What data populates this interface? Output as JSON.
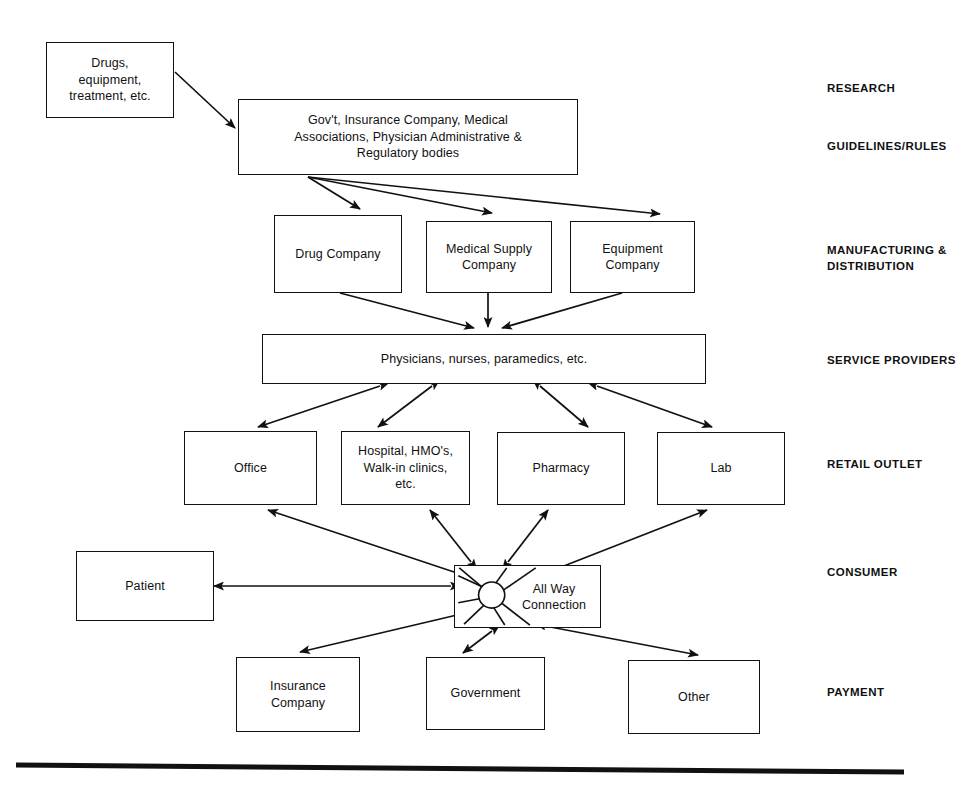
{
  "diagram": {
    "background_color": "#ffffff",
    "line_color": "#111111",
    "nodes": {
      "research": {
        "label": "Drugs,\nequipment,\ntreatment, etc."
      },
      "guidelines": {
        "label": "Gov't, Insurance Company, Medical\nAssociations, Physician Administrative &\nRegulatory bodies"
      },
      "drug_company": {
        "label": "Drug Company"
      },
      "medical_supply": {
        "label": "Medical Supply\nCompany"
      },
      "equipment_company": {
        "label": "Equipment\nCompany"
      },
      "service_providers": {
        "label": "Physicians, nurses, paramedics, etc."
      },
      "office": {
        "label": "Office"
      },
      "hospital": {
        "label": "Hospital, HMO's,\nWalk-in clinics,\netc."
      },
      "pharmacy": {
        "label": "Pharmacy"
      },
      "lab": {
        "label": "Lab"
      },
      "patient": {
        "label": "Patient"
      },
      "all_way_connection": {
        "label": "All Way\nConnection"
      },
      "insurance_company": {
        "label": "Insurance\nCompany"
      },
      "government": {
        "label": "Government"
      },
      "other": {
        "label": "Other"
      }
    },
    "stage_labels": [
      {
        "id": "research",
        "label": "RESEARCH"
      },
      {
        "id": "guidelines",
        "label": "GUIDELINES/RULES"
      },
      {
        "id": "manufacturing",
        "label": "MANUFACTURING &\nDISTRIBUTION"
      },
      {
        "id": "service_providers",
        "label": "SERVICE PROVIDERS"
      },
      {
        "id": "retail_outlet",
        "label": "RETAIL OUTLET"
      },
      {
        "id": "consumer",
        "label": "CONSUMER"
      },
      {
        "id": "payment",
        "label": "PAYMENT"
      }
    ],
    "connections": [
      {
        "from": "research",
        "to": "guidelines",
        "type": "single"
      },
      {
        "from": "guidelines",
        "to": "drug_company",
        "type": "single"
      },
      {
        "from": "guidelines",
        "to": "medical_supply",
        "type": "single"
      },
      {
        "from": "guidelines",
        "to": "equipment_company",
        "type": "single"
      },
      {
        "from": "drug_company",
        "to": "service_providers",
        "type": "single"
      },
      {
        "from": "medical_supply",
        "to": "service_providers",
        "type": "single"
      },
      {
        "from": "equipment_company",
        "to": "service_providers",
        "type": "single"
      },
      {
        "from": "service_providers",
        "to": "office",
        "type": "double"
      },
      {
        "from": "service_providers",
        "to": "hospital",
        "type": "double"
      },
      {
        "from": "service_providers",
        "to": "pharmacy",
        "type": "double"
      },
      {
        "from": "service_providers",
        "to": "lab",
        "type": "double"
      },
      {
        "from": "all_way_connection",
        "to": "office",
        "type": "double"
      },
      {
        "from": "all_way_connection",
        "to": "hospital",
        "type": "double"
      },
      {
        "from": "all_way_connection",
        "to": "pharmacy",
        "type": "double"
      },
      {
        "from": "all_way_connection",
        "to": "lab",
        "type": "double"
      },
      {
        "from": "all_way_connection",
        "to": "patient",
        "type": "double"
      },
      {
        "from": "all_way_connection",
        "to": "insurance_company",
        "type": "double"
      },
      {
        "from": "all_way_connection",
        "to": "government",
        "type": "double"
      },
      {
        "from": "all_way_connection",
        "to": "other",
        "type": "double"
      }
    ]
  }
}
